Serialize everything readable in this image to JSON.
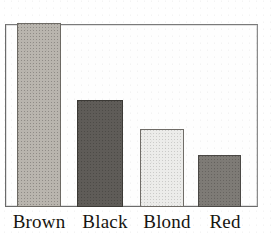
{
  "chart_data": {
    "type": "bar",
    "title": "",
    "subtitle": "",
    "xlabel": "",
    "ylabel": "",
    "categories": [
      "Brown",
      "Black",
      "Blond",
      "Red"
    ],
    "values": [
      182,
      106,
      77,
      51
    ],
    "ylim": [
      0,
      183
    ],
    "grid": false,
    "legend": null,
    "axis_tick_labels": {
      "x": [
        "Brown",
        "Black",
        "Blond",
        "Red"
      ],
      "y": []
    },
    "annotations": [],
    "series": [
      {
        "name": "Hair colour frequency",
        "values": [
          182,
          106,
          77,
          51
        ]
      }
    ],
    "bars": [
      {
        "category": "Brown",
        "value": 182,
        "fill": "#b9b5ae",
        "outline": "#6d6a64",
        "texture": "dithered-medium-gray"
      },
      {
        "category": "Black",
        "value": 106,
        "fill": "#5f5c58",
        "outline": "#3b3935",
        "texture": "dithered-dark-gray"
      },
      {
        "category": "Blond",
        "value": 77,
        "fill": "#ececea",
        "outline": "#6f6c67",
        "texture": "dithered-near-white"
      },
      {
        "category": "Red",
        "value": 51,
        "fill": "#7e7b76",
        "outline": "#4a4845",
        "texture": "dithered-mid-dark-gray"
      }
    ]
  },
  "figure": {
    "background": "#ffffff",
    "frame_color": "#6b6b6b",
    "label_color": "#17150f"
  },
  "labels": {
    "brown": "Brown",
    "black": "Black",
    "blond": "Blond",
    "red": "Red"
  }
}
